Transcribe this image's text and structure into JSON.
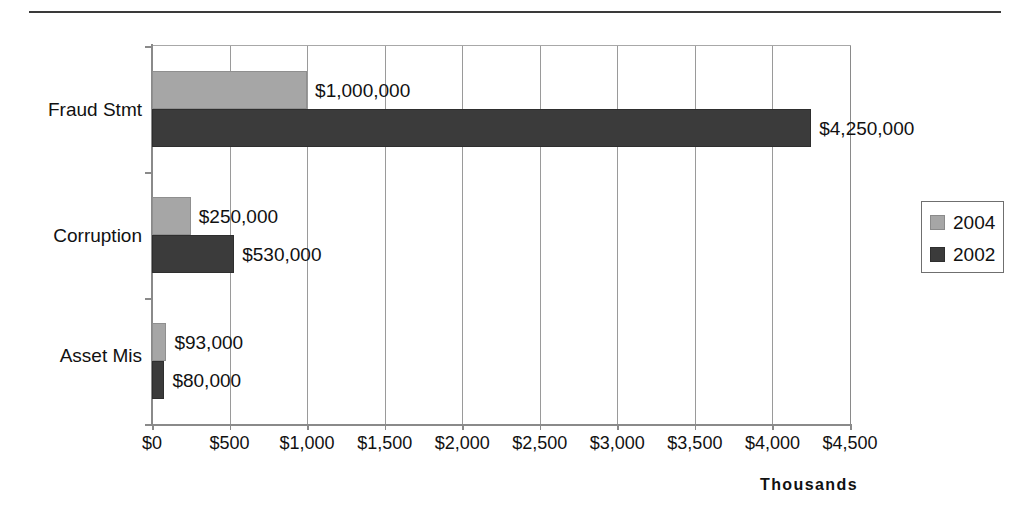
{
  "chart_data": {
    "type": "bar",
    "orientation": "horizontal",
    "title": "",
    "categories": [
      "Fraud Stmt",
      "Corruption",
      "Asset Mis"
    ],
    "series": [
      {
        "name": "2004",
        "color": "#a6a6a6",
        "values": [
          1000,
          250,
          93
        ],
        "labels": [
          "$1,000,000",
          "$250,000",
          "$93,000"
        ]
      },
      {
        "name": "2002",
        "color": "#3b3b3b",
        "values": [
          4250,
          530,
          80
        ],
        "labels": [
          "$4,250,000",
          "$530,000",
          "$80,000"
        ]
      }
    ],
    "xlabel": "Thousands",
    "ylabel": "",
    "xlim": [
      0,
      4500
    ],
    "xticks": [
      0,
      500,
      1000,
      1500,
      2000,
      2500,
      3000,
      3500,
      4000,
      4500
    ],
    "xticklabels": [
      "$0",
      "$500",
      "$1,000",
      "$1,500",
      "$2,000",
      "$2,500",
      "$3,000",
      "$3,500",
      "$4,000",
      "$4,500"
    ],
    "grid": true,
    "legend_position": "right",
    "units_note": "Bar values are expressed in thousands of dollars; data labels show full dollar amounts."
  },
  "legend": {
    "entries": [
      {
        "label": "2004",
        "color": "#a6a6a6"
      },
      {
        "label": "2002",
        "color": "#3b3b3b"
      }
    ]
  },
  "axis": {
    "x_title": "Thousands"
  }
}
